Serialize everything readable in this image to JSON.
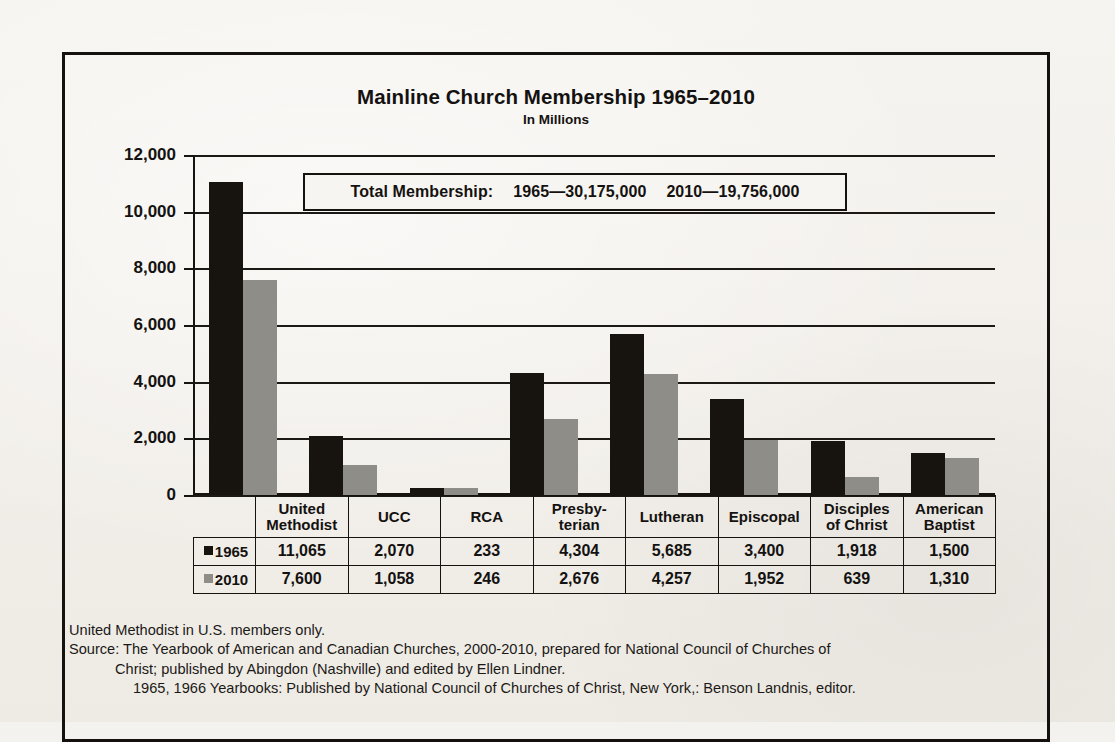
{
  "chart_data": {
    "type": "bar",
    "title": "Mainline Church Membership 1965–2010",
    "subtitle": "In Millions",
    "xlabel": "",
    "ylabel": "",
    "ylim": [
      0,
      12000
    ],
    "ytick_step": 2000,
    "grid": true,
    "legend_position": "table-row-labels",
    "categories": [
      "United Methodist",
      "UCC",
      "RCA",
      "Presbyterian",
      "Lutheran",
      "Episcopal",
      "Disciples of Christ",
      "American Baptist"
    ],
    "category_lines": [
      [
        "United",
        "Methodist"
      ],
      [
        "UCC"
      ],
      [
        "RCA"
      ],
      [
        "Presby-",
        "terian"
      ],
      [
        "Lutheran"
      ],
      [
        "Episcopal"
      ],
      [
        "Disciples",
        "of Christ"
      ],
      [
        "American",
        "Baptist"
      ]
    ],
    "ticks": [
      "12,000",
      "10,000",
      "8,000",
      "6,000",
      "4,000",
      "2,000",
      "0"
    ],
    "tick_values": [
      12000,
      10000,
      8000,
      6000,
      4000,
      2000,
      0
    ],
    "series": [
      {
        "name": "1965",
        "color": "#17130f",
        "values": [
          11065,
          2070,
          233,
          4304,
          5685,
          3400,
          1918,
          1500
        ],
        "labels": [
          "11,065",
          "2,070",
          "233",
          "4,304",
          "5,685",
          "3,400",
          "1,918",
          "1,500"
        ]
      },
      {
        "name": "2010",
        "color": "#8e8d88",
        "values": [
          7600,
          1058,
          246,
          2676,
          4257,
          1952,
          639,
          1310
        ],
        "labels": [
          "7,600",
          "1,058",
          "246",
          "2,676",
          "4,257",
          "1,952",
          "639",
          "1,310"
        ]
      }
    ],
    "annotation": {
      "prefix": "Total Membership:",
      "part1": "1965—30,175,000",
      "part2": "2010—19,756,000"
    }
  },
  "footnotes": {
    "line1": "United Methodist in U.S. members only.",
    "line2": "Source: The Yearbook of American and Canadian Churches, 2000-2010, prepared for National Council of Churches of",
    "line3": "Christ; published by Abingdon (Nashville) and edited by Ellen Lindner.",
    "line4": "1965, 1966 Yearbooks: Published by National Council of Churches of Christ, New York,: Benson Landnis, editor."
  }
}
